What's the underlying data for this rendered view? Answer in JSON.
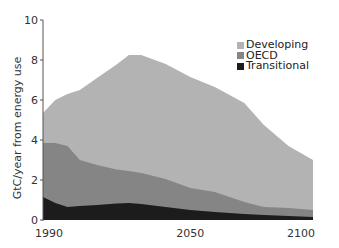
{
  "chart_data": {
    "type": "area",
    "stacked": true,
    "title": "",
    "xlabel": "",
    "ylabel": "GtC/year from energy use",
    "xlim": [
      1990,
      2100
    ],
    "ylim": [
      0,
      10
    ],
    "x_ticks": [
      1990,
      2050,
      2100
    ],
    "y_ticks": [
      0,
      2,
      4,
      6,
      8,
      10
    ],
    "grid": false,
    "legend_position": "upper right",
    "x": [
      1990,
      1995,
      2000,
      2005,
      2012,
      2020,
      2025,
      2030,
      2040,
      2050,
      2060,
      2072,
      2080,
      2090,
      2100
    ],
    "series": [
      {
        "name": "Transitional",
        "color": "#1c1c1c",
        "values": [
          1.15,
          0.85,
          0.65,
          0.7,
          0.75,
          0.82,
          0.85,
          0.8,
          0.65,
          0.5,
          0.4,
          0.3,
          0.25,
          0.2,
          0.15
        ]
      },
      {
        "name": "OECD",
        "color": "#858585",
        "values": [
          2.7,
          3.0,
          3.05,
          2.3,
          2.0,
          1.7,
          1.6,
          1.55,
          1.4,
          1.1,
          1.0,
          0.6,
          0.4,
          0.4,
          0.35
        ]
      },
      {
        "name": "Developing",
        "color": "#b3b3b3",
        "values": [
          1.5,
          2.15,
          2.6,
          3.5,
          4.35,
          5.25,
          5.8,
          5.9,
          5.75,
          5.55,
          5.25,
          4.95,
          4.1,
          3.1,
          2.5
        ]
      }
    ],
    "totals": [
      5.35,
      6.0,
      6.3,
      6.5,
      7.1,
      7.77,
      8.25,
      8.25,
      7.8,
      7.15,
      6.65,
      5.85,
      4.75,
      3.7,
      3.0
    ]
  },
  "axes": {
    "y_title": "GtC/year from energy use",
    "y_tick_labels": [
      "0",
      "2",
      "4",
      "6",
      "8",
      "10"
    ],
    "x_tick_labels": [
      "1990",
      "2050",
      "2100"
    ]
  },
  "legend": [
    {
      "label": "Developing",
      "color": "#b3b3b3"
    },
    {
      "label": "OECD",
      "color": "#858585"
    },
    {
      "label": "Transitional",
      "color": "#1c1c1c"
    }
  ]
}
